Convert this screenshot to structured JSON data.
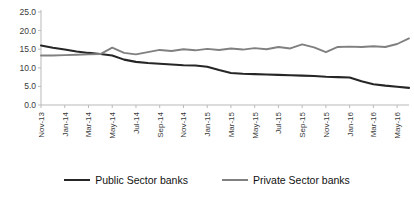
{
  "chart_data": {
    "type": "line",
    "title": "",
    "subtitle": "",
    "xlabel": "",
    "ylabel": "",
    "ylim": [
      0.0,
      25.0
    ],
    "yticks": [
      "0.0",
      "5.0",
      "10.0",
      "15.0",
      "20.0",
      "25.0"
    ],
    "ytick_values": [
      0.0,
      5.0,
      10.0,
      15.0,
      20.0,
      25.0
    ],
    "grid": false,
    "legend_position": "bottom",
    "x": [
      "Nov-13",
      "Dec-13",
      "Jan-14",
      "Feb-14",
      "Mar-14",
      "Apr-14",
      "May-14",
      "Jun-14",
      "Jul-14",
      "Aug-14",
      "Sep-14",
      "Oct-14",
      "Nov-14",
      "Dec-14",
      "Jan-15",
      "Feb-15",
      "Mar-15",
      "Apr-15",
      "May-15",
      "Jun-15",
      "Jul-15",
      "Aug-15",
      "Sep-15",
      "Oct-15",
      "Nov-15",
      "Dec-15",
      "Jan-16",
      "Feb-16",
      "Mar-16",
      "Apr-16",
      "May-16",
      "Jun-16"
    ],
    "xtick_labels": [
      "Nov-13",
      "Jan-14",
      "Mar-14",
      "May-14",
      "Jul-14",
      "Sep-14",
      "Nov-14",
      "Jan-15",
      "Mar-15",
      "May-15",
      "Jul-15",
      "Sep-15",
      "Nov-15",
      "Jan-16",
      "Mar-16",
      "May-16"
    ],
    "xtick_indices": [
      0,
      2,
      4,
      6,
      8,
      10,
      12,
      14,
      16,
      18,
      20,
      22,
      24,
      26,
      28,
      30
    ],
    "series": [
      {
        "name": "Public Sector banks",
        "color": "#262626",
        "values": [
          16.0,
          15.4,
          14.9,
          14.4,
          14.0,
          13.7,
          13.3,
          12.2,
          11.6,
          11.3,
          11.1,
          10.9,
          10.7,
          10.6,
          10.3,
          9.4,
          8.6,
          8.4,
          8.3,
          8.2,
          8.1,
          8.0,
          7.9,
          7.8,
          7.6,
          7.5,
          7.4,
          6.4,
          5.6,
          5.2,
          4.9,
          4.6
        ]
      },
      {
        "name": "Private Sector banks",
        "color": "#808080",
        "values": [
          13.3,
          13.3,
          13.4,
          13.5,
          13.6,
          13.7,
          15.4,
          14.0,
          13.6,
          14.2,
          14.8,
          14.5,
          15.0,
          14.7,
          15.1,
          14.8,
          15.2,
          14.9,
          15.3,
          15.0,
          15.6,
          15.2,
          16.3,
          15.5,
          14.2,
          15.6,
          15.7,
          15.6,
          15.8,
          15.6,
          16.4,
          17.9
        ]
      }
    ]
  },
  "legend": {
    "items": [
      {
        "label": "Public Sector banks",
        "color": "#262626"
      },
      {
        "label": "Private Sector banks",
        "color": "#808080"
      }
    ]
  }
}
